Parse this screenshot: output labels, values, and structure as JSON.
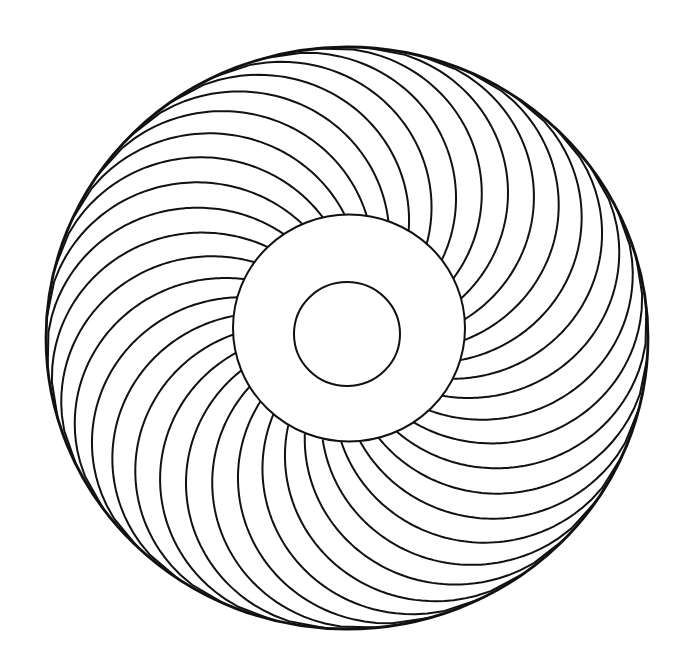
{
  "artwork": {
    "title": "Spiral mandala line art",
    "canvas": {
      "width": 692,
      "height": 661,
      "background": "#ffffff"
    },
    "stroke_color": "#111111",
    "outer_ring": {
      "cx": 347,
      "cy": 338,
      "rx": 301,
      "ry": 291,
      "stroke_width": 2.8
    },
    "middle_ring": {
      "cx": 349,
      "cy": 328,
      "rx": 116,
      "ry": 113.5,
      "stroke_width": 2.0
    },
    "inner_ring": {
      "cx": 347,
      "cy": 334,
      "rx": 53,
      "ry": 52,
      "stroke_width": 2.0
    },
    "spiral_curves": {
      "count": 36,
      "stroke_width": 2.0,
      "sweep_direction": "counterclockwise",
      "start_offset_deg": 4,
      "inner_radius_ratio": 0.36
    }
  }
}
